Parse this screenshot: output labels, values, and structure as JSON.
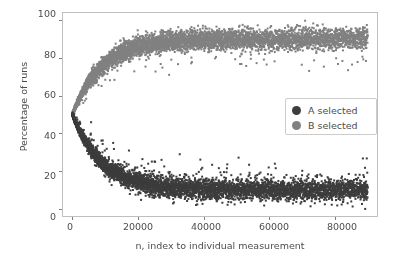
{
  "chart_data": {
    "type": "scatter",
    "title": "",
    "xlabel": "n, index to individual measurement",
    "ylabel": "Percentage of runs",
    "xlim": [
      -3000,
      93000
    ],
    "ylim": [
      -4,
      104
    ],
    "xticks": [
      0,
      20000,
      40000,
      60000,
      80000
    ],
    "xtick_labels": [
      "0",
      "20000",
      "40000",
      "60000",
      "80000"
    ],
    "yticks": [
      0,
      20,
      40,
      60,
      80,
      100
    ],
    "ytick_labels": [
      "0",
      "20",
      "40",
      "60",
      "80",
      "100"
    ],
    "grid": false,
    "legend_position": "center right",
    "series": [
      {
        "name": "A selected",
        "color": "#3d3d3d",
        "marker": "circle",
        "marker_size": 2,
        "description": "Decays from about 50% at n=0 down to a plateau near 10%, with scatter band roughly 5 to 16 percent beyond n=40000",
        "start_value": 50,
        "plateau_value": 10,
        "plateau_band": [
          5,
          16
        ],
        "n_points": 9000
      },
      {
        "name": "B selected",
        "color": "#808080",
        "marker": "circle",
        "marker_size": 2,
        "description": "Rises from about 50% at n=0 up to a plateau near 91%, with scatter band roughly 86 to 97 percent beyond n=40000",
        "start_value": 50,
        "plateau_value": 90,
        "plateau_band": [
          86,
          97
        ],
        "n_points": 9000
      }
    ],
    "x_data_range": [
      0,
      90000
    ]
  },
  "legend": {
    "entries": [
      {
        "label": "A selected",
        "color": "#3d3d3d"
      },
      {
        "label": "B selected",
        "color": "#808080"
      }
    ]
  },
  "axes": {
    "spine_color": "#bfbfbf",
    "tick_color": "#808080",
    "text_color": "#4d4d4d",
    "background": "#ffffff"
  }
}
